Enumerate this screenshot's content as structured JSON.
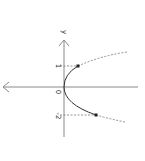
{
  "diagram": {
    "type": "parabola-plot",
    "axis_label_vertical": "y",
    "tick_labels": {
      "upper": "1",
      "origin": "0",
      "lower": "-2"
    },
    "curve": "x = y^2 style parabola opening right (rotated view)",
    "points": [
      {
        "name": "upper-point",
        "y": 1
      },
      {
        "name": "lower-point",
        "y": -2
      }
    ],
    "colors": {
      "axis": "#888888",
      "curve": "#333333",
      "dashed": "#777777",
      "point": "#222222"
    }
  }
}
